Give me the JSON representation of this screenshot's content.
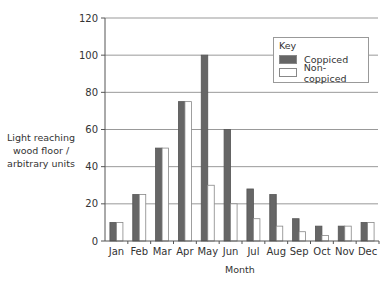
{
  "chart_data": {
    "type": "bar",
    "title": "",
    "xlabel": "Month",
    "ylabel": "Light reaching wood floor / arbitrary units",
    "ylabel_lines": [
      "Light reaching",
      "wood floor /",
      "arbitrary units"
    ],
    "categories": [
      "Jan",
      "Feb",
      "Mar",
      "Apr",
      "May",
      "Jun",
      "Jul",
      "Aug",
      "Sep",
      "Oct",
      "Nov",
      "Dec"
    ],
    "series": [
      {
        "name": "Coppiced",
        "color": "#666666",
        "values": [
          10,
          25,
          50,
          75,
          100,
          60,
          28,
          25,
          12,
          8,
          8,
          10
        ]
      },
      {
        "name": "Non-coppiced",
        "color": "#ffffff",
        "values": [
          10,
          25,
          50,
          75,
          30,
          20,
          12,
          8,
          5,
          3,
          8,
          10
        ]
      }
    ],
    "ylim": [
      0,
      120
    ],
    "yticks": [
      0,
      20,
      40,
      60,
      80,
      100,
      120
    ],
    "grid": true,
    "legend": {
      "title": "Key",
      "position": "top-right"
    }
  }
}
